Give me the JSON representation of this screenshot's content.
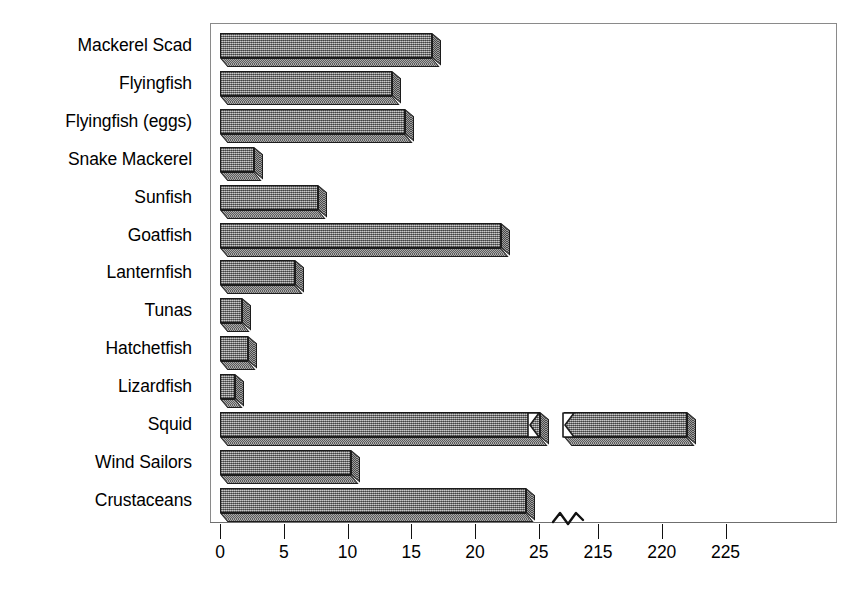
{
  "chart_data": {
    "type": "bar",
    "orientation": "horizontal",
    "title": "",
    "xlabel": "",
    "ylabel": "",
    "grid": false,
    "legend": null,
    "axis_break": {
      "present": true,
      "symbol": "~",
      "between": [
        25,
        215
      ]
    },
    "xlim_segments": [
      [
        0,
        25
      ],
      [
        215,
        227
      ]
    ],
    "xticks_segment1": [
      0,
      5,
      10,
      15,
      20,
      25
    ],
    "xticks_segment2": [
      215,
      220,
      225
    ],
    "xtick_labels": [
      "0",
      "5",
      "10",
      "15",
      "20",
      "25",
      "215",
      "220",
      "225"
    ],
    "categories": [
      "Mackerel Scad",
      "Flyingfish",
      "Flyingfish (eggs)",
      "Snake Mackerel",
      "Sunfish",
      "Goatfish",
      "Lanternfish",
      "Tunas",
      "Hatchetfish",
      "Lizardfish",
      "Squid",
      "Wind Sailors",
      "Crustaceans"
    ],
    "values": [
      16.6,
      13.5,
      14.5,
      2.7,
      7.7,
      22.0,
      5.9,
      1.7,
      2.2,
      1.2,
      222.0,
      10.3,
      24.0
    ],
    "broken_bars": [
      "Squid"
    ]
  },
  "bars": [
    {
      "label": "Mackerel Scad",
      "value": 16.6,
      "broken": false
    },
    {
      "label": "Flyingfish",
      "value": 13.5,
      "broken": false
    },
    {
      "label": "Flyingfish (eggs)",
      "value": 14.5,
      "broken": false
    },
    {
      "label": "Snake Mackerel",
      "value": 2.7,
      "broken": false
    },
    {
      "label": "Sunfish",
      "value": 7.7,
      "broken": false
    },
    {
      "label": "Goatfish",
      "value": 22.0,
      "broken": false
    },
    {
      "label": "Lanternfish",
      "value": 5.9,
      "broken": false
    },
    {
      "label": "Tunas",
      "value": 1.7,
      "broken": false
    },
    {
      "label": "Hatchetfish",
      "value": 2.2,
      "broken": false
    },
    {
      "label": "Lizardfish",
      "value": 1.2,
      "broken": false
    },
    {
      "label": "Squid",
      "value": 222.0,
      "broken": true
    },
    {
      "label": "Wind Sailors",
      "value": 10.3,
      "broken": false
    },
    {
      "label": "Crustaceans",
      "value": 24.0,
      "broken": false
    }
  ],
  "axis": {
    "ticks": [
      {
        "label": "0",
        "value": 0,
        "segment": 1
      },
      {
        "label": "5",
        "value": 5,
        "segment": 1
      },
      {
        "label": "10",
        "value": 10,
        "segment": 1
      },
      {
        "label": "15",
        "value": 15,
        "segment": 1
      },
      {
        "label": "20",
        "value": 20,
        "segment": 1
      },
      {
        "label": "25",
        "value": 25,
        "segment": 1
      },
      {
        "label": "215",
        "value": 215,
        "segment": 2
      },
      {
        "label": "220",
        "value": 220,
        "segment": 2
      },
      {
        "label": "225",
        "value": 225,
        "segment": 2
      }
    ],
    "break_symbol": "~"
  },
  "colors": {
    "bar_fill": "#9d9d9d",
    "bar_outline": "#1c1c1c",
    "bar_side": "#7e7e7e",
    "axis": "#6f6f6f",
    "frame": "#8a8a8a",
    "text": "#000000",
    "background": "#ffffff"
  }
}
